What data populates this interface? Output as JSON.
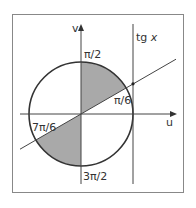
{
  "diagram": {
    "type": "unit-circle-tangent",
    "colors": {
      "frame": "#888888",
      "stroke": "#333333",
      "shade": "#a9a9a9",
      "background": "#ffffff"
    },
    "axes": {
      "horizontal_label": "u",
      "vertical_label": "v"
    },
    "tangent_line_label_prefix": "tg ",
    "tangent_line_label_var": "x",
    "angle_labels": {
      "top": "π/2",
      "first": "π/6",
      "third": "7π/6",
      "bottom": "3π/2"
    },
    "shaded_sectors": [
      {
        "from": "π/6",
        "to": "π/2"
      },
      {
        "from": "7π/6",
        "to": "3π/2"
      }
    ]
  }
}
